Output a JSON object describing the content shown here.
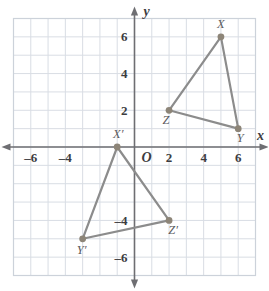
{
  "chart_data": {
    "type": "scatter",
    "title": "",
    "xlabel": "x",
    "ylabel": "y",
    "origin_label": "O",
    "xlim": [
      -7,
      7
    ],
    "ylim": [
      -7,
      7
    ],
    "grid": true,
    "grid_step": 1,
    "x_ticks": [
      -6,
      -4,
      2,
      4,
      6
    ],
    "x_tick_labels": [
      "–6",
      "–4",
      "2",
      "4",
      "6"
    ],
    "y_ticks": [
      6,
      4,
      2,
      -4,
      -6
    ],
    "y_tick_labels": [
      "6",
      "4",
      "2",
      "–4",
      "–6"
    ],
    "legend": "none",
    "series": [
      {
        "name": "Triangle XYZ",
        "closed": true,
        "points": [
          {
            "label": "X",
            "x": 5,
            "y": 6,
            "label_dx": 0,
            "label_dy": -9
          },
          {
            "label": "Y",
            "x": 6,
            "y": 1,
            "label_dx": 2,
            "label_dy": 13
          },
          {
            "label": "Z",
            "x": 2,
            "y": 2,
            "label_dx": -3,
            "label_dy": 14
          }
        ]
      },
      {
        "name": "Triangle X'Y'Z'",
        "closed": true,
        "points": [
          {
            "label": "X′",
            "x": -1,
            "y": 0,
            "label_dx": 1,
            "label_dy": -9
          },
          {
            "label": "Y′",
            "x": -3,
            "y": -5,
            "label_dx": -1,
            "label_dy": 15
          },
          {
            "label": "Z′",
            "x": 2,
            "y": -4,
            "label_dx": 4,
            "label_dy": 14
          }
        ]
      }
    ],
    "colors": {
      "grid": "#d9dde4",
      "axis": "#6e6e72",
      "edge": "#8c8c8c",
      "vertex": "#8d8578",
      "tick_text": "#3c3c40",
      "vertex_text": "#5b5b5e",
      "background": "#ffffff"
    }
  }
}
